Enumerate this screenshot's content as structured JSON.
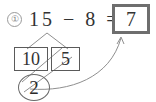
{
  "worksheet": {
    "problem_number": "①",
    "equation": {
      "minuend": "15",
      "operator": "−",
      "subtrahend": "8",
      "equals": "=",
      "text": "15 − 8 ="
    },
    "answer": "7",
    "decomposition": {
      "tens_part": "10",
      "ones_part": "5"
    },
    "remainder": "2",
    "colors": {
      "ink": "#333333",
      "answer_box_border": "#6e6e6e",
      "part_box_border": "#5a5a5a",
      "marker_line": "#8f8f8f",
      "background": "#ffffff"
    }
  }
}
